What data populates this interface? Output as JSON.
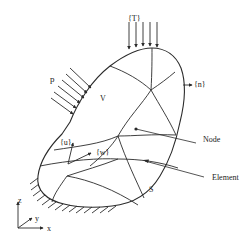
{
  "figure": {
    "colors": {
      "ink": "#2a2a2a",
      "background": "#ffffff"
    },
    "labels": {
      "traction": "{T}",
      "pressure": "p",
      "volume": "V",
      "normal": "{n}",
      "node": "Node",
      "element": "Element",
      "surface": "S",
      "displacement": "{u}",
      "weight": "{w}"
    },
    "axes": {
      "x": "x",
      "y": "y",
      "z": "z"
    }
  }
}
